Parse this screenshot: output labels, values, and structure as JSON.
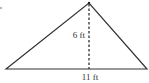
{
  "diagram": {
    "shape": "triangle",
    "height_label": "6 ft",
    "base_label": "11 ft",
    "colors": {
      "stroke": "#333333",
      "background": "#ffffff"
    }
  }
}
